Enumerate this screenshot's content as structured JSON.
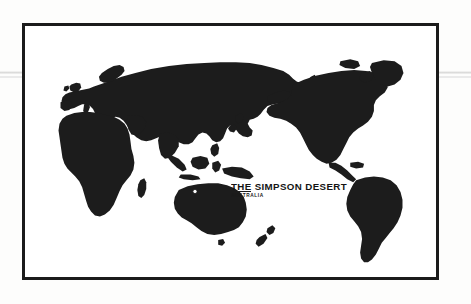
{
  "document": {
    "type": "world-map-plate",
    "background_color": "#fdfdfc",
    "frame_color": "#1b1b1b",
    "land_color": "#1c1c1c",
    "ocean_color": "#ffffff"
  },
  "callout": {
    "title": "THE SIMPSON DESERT",
    "subtitle": "AUSTRALIA",
    "leader_line_label": "leader-line",
    "marker_label": "location-marker"
  },
  "map": {
    "title": "World map silhouette",
    "landmasses": [
      "Africa",
      "Europe",
      "Asia",
      "Australia",
      "New Zealand",
      "North America",
      "South America",
      "Greenland",
      "Japan",
      "Madagascar",
      "British Isles",
      "Indonesia",
      "Philippines",
      "New Guinea"
    ]
  }
}
